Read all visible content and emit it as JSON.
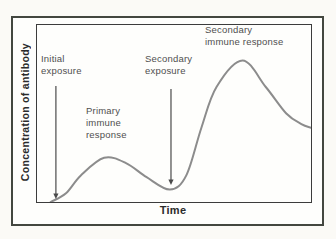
{
  "figure": {
    "background": "#fbfaf6",
    "frame_background": "#fefefc",
    "frame_border": "#43473f"
  },
  "chart_data": {
    "type": "line",
    "title": "",
    "xlabel": "Time",
    "ylabel": "Concentration of antibody",
    "x_range": [
      0,
      100
    ],
    "y_range": [
      0,
      100
    ],
    "grid": false,
    "legend": "none",
    "axes_style": "qualitative-no-ticks",
    "series": [
      {
        "name": "Antibody concentration",
        "color": "#8c8c8c",
        "stroke_width": 2,
        "points": [
          [
            5,
            0
          ],
          [
            10.6,
            5
          ],
          [
            16,
            15
          ],
          [
            24.5,
            25
          ],
          [
            32.5,
            22
          ],
          [
            40,
            14
          ],
          [
            48.5,
            7
          ],
          [
            54.5,
            15
          ],
          [
            60,
            42
          ],
          [
            65.5,
            65
          ],
          [
            75,
            80
          ],
          [
            83.5,
            65
          ],
          [
            91,
            50
          ],
          [
            96.5,
            44
          ],
          [
            100,
            42
          ]
        ]
      }
    ],
    "annotation_color": "#4a4a4a",
    "annotations": [
      {
        "id": "initial-exposure",
        "label": "Initial\nexposure",
        "arrow": {
          "x": 6.9,
          "y_from": 65.5,
          "y_to": 1.7
        }
      },
      {
        "id": "secondary-exposure",
        "label": "Secondary\nexposure",
        "arrow": {
          "x": 48.9,
          "y_from": 63.8,
          "y_to": 9.6
        }
      },
      {
        "id": "primary-immune-response",
        "label": "Primary\nimmune\nresponse"
      },
      {
        "id": "secondary-immune-response",
        "label": "Secondary\nimmune response"
      }
    ]
  }
}
